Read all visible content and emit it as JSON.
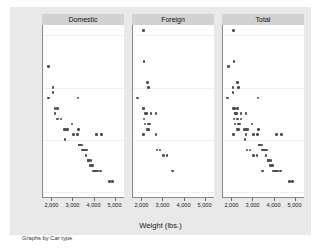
{
  "figure": {
    "note": "Graphs by Car type",
    "background_color": "#e9e9e9",
    "panel_title_color": "#d2d2d2",
    "marker_color": "#4d4d4d"
  },
  "chart_data": {
    "type": "scatter",
    "title": "",
    "xlabel": "Weight (lbs.)",
    "ylabel": "Mileage (mpg)",
    "xlim": [
      1600,
      5400
    ],
    "ylim": [
      9,
      42
    ],
    "xticks": [
      2000,
      3000,
      4000,
      5000
    ],
    "xticklabels": [
      "2,000",
      "3,000",
      "4,000",
      "5,000"
    ],
    "yticks": [
      10,
      20,
      30,
      40
    ],
    "yticklabels": [
      "10",
      "20",
      "30",
      "40"
    ],
    "grid": true,
    "legend": "none",
    "by_variable": "Car type",
    "panels": [
      {
        "label": "Domestic",
        "points": [
          [
            1800,
            34
          ],
          [
            1800,
            28
          ],
          [
            2020,
            30
          ],
          [
            2020,
            29
          ],
          [
            2130,
            26
          ],
          [
            2130,
            25
          ],
          [
            2230,
            26
          ],
          [
            2230,
            24
          ],
          [
            2410,
            24
          ],
          [
            2580,
            22
          ],
          [
            2650,
            22
          ],
          [
            2600,
            20
          ],
          [
            2730,
            22
          ],
          [
            2930,
            23
          ],
          [
            3000,
            21
          ],
          [
            3180,
            21
          ],
          [
            3210,
            28
          ],
          [
            3250,
            22
          ],
          [
            3280,
            19
          ],
          [
            3300,
            19
          ],
          [
            3350,
            19
          ],
          [
            3400,
            19
          ],
          [
            3420,
            18
          ],
          [
            3470,
            18
          ],
          [
            3520,
            18
          ],
          [
            3600,
            17
          ],
          [
            3620,
            18
          ],
          [
            3690,
            16
          ],
          [
            3700,
            16
          ],
          [
            3730,
            16
          ],
          [
            3800,
            15
          ],
          [
            3830,
            16
          ],
          [
            3900,
            15
          ],
          [
            3940,
            14
          ],
          [
            4000,
            14
          ],
          [
            4060,
            14
          ],
          [
            4080,
            21
          ],
          [
            4130,
            14
          ],
          [
            4290,
            14
          ],
          [
            4330,
            21
          ],
          [
            4720,
            12
          ],
          [
            4840,
            12
          ]
        ]
      },
      {
        "label": "Foreign",
        "points": [
          [
            2050,
            41
          ],
          [
            2070,
            35
          ],
          [
            2230,
            31
          ],
          [
            2280,
            30
          ],
          [
            1760,
            28
          ],
          [
            2050,
            26
          ],
          [
            2160,
            25
          ],
          [
            2200,
            25
          ],
          [
            2400,
            25
          ],
          [
            2650,
            25
          ],
          [
            2070,
            24
          ],
          [
            2280,
            23
          ],
          [
            2330,
            23
          ],
          [
            2130,
            23
          ],
          [
            2240,
            22
          ],
          [
            2280,
            22
          ],
          [
            2050,
            21
          ],
          [
            2650,
            21
          ],
          [
            2690,
            18
          ],
          [
            2830,
            18
          ],
          [
            3000,
            17
          ],
          [
            3170,
            17
          ],
          [
            3420,
            14
          ]
        ]
      },
      {
        "label": "Total",
        "points": [
          [
            2050,
            41
          ],
          [
            1800,
            34
          ],
          [
            2070,
            35
          ],
          [
            2020,
            30
          ],
          [
            2020,
            29
          ],
          [
            2230,
            31
          ],
          [
            2280,
            30
          ],
          [
            1760,
            28
          ],
          [
            2130,
            26
          ],
          [
            2130,
            25
          ],
          [
            2230,
            26
          ],
          [
            2230,
            24
          ],
          [
            2050,
            26
          ],
          [
            2160,
            25
          ],
          [
            2200,
            25
          ],
          [
            2400,
            25
          ],
          [
            2650,
            25
          ],
          [
            2070,
            24
          ],
          [
            2410,
            24
          ],
          [
            2280,
            23
          ],
          [
            2330,
            23
          ],
          [
            2130,
            23
          ],
          [
            2240,
            22
          ],
          [
            2280,
            22
          ],
          [
            2580,
            22
          ],
          [
            2650,
            22
          ],
          [
            2600,
            20
          ],
          [
            2050,
            21
          ],
          [
            2730,
            22
          ],
          [
            2930,
            23
          ],
          [
            3000,
            21
          ],
          [
            3180,
            21
          ],
          [
            3210,
            28
          ],
          [
            3250,
            22
          ],
          [
            2650,
            21
          ],
          [
            3280,
            19
          ],
          [
            3300,
            19
          ],
          [
            3350,
            19
          ],
          [
            3400,
            19
          ],
          [
            3420,
            18
          ],
          [
            3470,
            18
          ],
          [
            3520,
            18
          ],
          [
            2690,
            18
          ],
          [
            2830,
            18
          ],
          [
            3600,
            17
          ],
          [
            3620,
            18
          ],
          [
            3000,
            17
          ],
          [
            3170,
            17
          ],
          [
            3690,
            16
          ],
          [
            3700,
            16
          ],
          [
            3730,
            16
          ],
          [
            3800,
            15
          ],
          [
            3830,
            16
          ],
          [
            3900,
            15
          ],
          [
            3940,
            14
          ],
          [
            4000,
            14
          ],
          [
            4060,
            14
          ],
          [
            4080,
            21
          ],
          [
            4130,
            14
          ],
          [
            4290,
            14
          ],
          [
            4330,
            21
          ],
          [
            3420,
            14
          ],
          [
            4720,
            12
          ],
          [
            4840,
            12
          ]
        ]
      }
    ]
  }
}
